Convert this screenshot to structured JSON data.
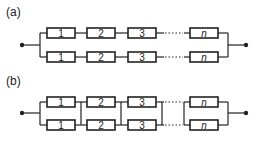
{
  "diagram": {
    "type": "reliability-block-diagram",
    "panels": [
      {
        "id": "a",
        "label": "(a)",
        "description": "Parallel of two series chains (system-level redundancy)",
        "rows": [
          {
            "blocks": [
              "1",
              "2",
              "3",
              "n"
            ]
          },
          {
            "blocks": [
              "1",
              "2",
              "3",
              "n"
            ]
          }
        ],
        "cross_links": false
      },
      {
        "id": "b",
        "label": "(b)",
        "description": "Series of parallel pairs (component-level redundancy)",
        "rows": [
          {
            "blocks": [
              "1",
              "2",
              "3",
              "n"
            ]
          },
          {
            "blocks": [
              "1",
              "2",
              "3",
              "n"
            ]
          }
        ],
        "cross_links": true
      }
    ],
    "colors": {
      "line": "#222222",
      "background": "#ffffff"
    }
  }
}
